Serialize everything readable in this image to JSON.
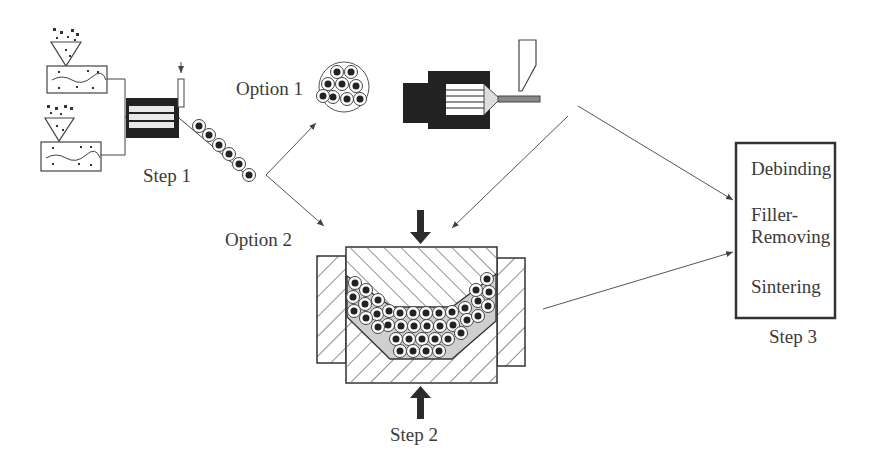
{
  "labels": {
    "step1": "Step 1",
    "step2": "Step 2",
    "step3": "Step 3",
    "option1": "Option 1",
    "option2": "Option 2"
  },
  "step3_box": {
    "items": [
      "Debinding",
      "Filler-",
      "Removing",
      "Sintering"
    ]
  },
  "colors": {
    "ink": "#333333",
    "fill_dark": "#2b2b2b",
    "line": "#555555"
  }
}
